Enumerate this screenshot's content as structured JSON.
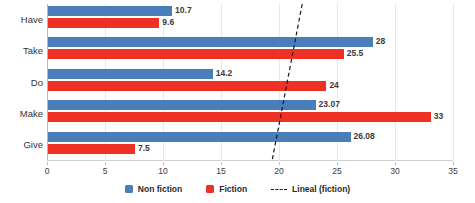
{
  "chart_data": {
    "type": "bar",
    "orientation": "horizontal",
    "title": "",
    "xlabel": "",
    "ylabel": "",
    "categories": [
      "Have",
      "Take",
      "Do",
      "Make",
      "Give"
    ],
    "series": [
      {
        "name": "Non fiction",
        "color": "#4a7ebb",
        "values": [
          10.7,
          28,
          14.2,
          23.07,
          26.08
        ],
        "labels": [
          "10.7",
          "28",
          "14.2",
          "23.07",
          "26.08"
        ]
      },
      {
        "name": "Fiction",
        "color": "#ee3124",
        "values": [
          9.6,
          25.5,
          24,
          33,
          7.5
        ],
        "labels": [
          "9.6",
          "25.5",
          "24",
          "33",
          "7.5"
        ]
      }
    ],
    "trendline": {
      "name": "Lineal (fiction)",
      "style": "dashed",
      "color": "#1a1a1a",
      "x_start": 22.0,
      "x_end": 19.4
    },
    "xlim": [
      0,
      35
    ],
    "xticks": [
      0,
      5,
      10,
      15,
      20,
      25,
      30,
      35
    ],
    "xtick_labels": [
      "0",
      "5",
      "10",
      "15",
      "20",
      "25",
      "30",
      "35"
    ],
    "grid": true,
    "grid_axis": "x",
    "legend_position": "bottom",
    "legend": [
      "Non fiction",
      "Fiction",
      "Lineal (fiction)"
    ]
  }
}
